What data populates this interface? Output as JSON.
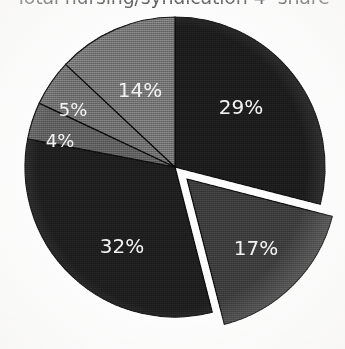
{
  "title": {
    "text": "Total nursing/syndication 4- share",
    "clipped": true
  },
  "chart_data": {
    "type": "pie",
    "title": "Total nursing/syndication 4- share",
    "xlabel": "",
    "ylabel": "",
    "grid": false,
    "legend": "none",
    "start_angle_deg": 0,
    "direction": "clockwise",
    "center": {
      "x": 175,
      "y": 158
    },
    "radius": 150,
    "total_pct": 101,
    "labels_inside": true,
    "label_color": "#f2f2f2",
    "categories": [
      "29%",
      "17%",
      "32%",
      "4%",
      "5%",
      "14%"
    ],
    "values": [
      29,
      17,
      32,
      4,
      5,
      14
    ],
    "slices": [
      {
        "label": "29%",
        "value": 29,
        "color": "#1c1c1c",
        "exploded": false,
        "start_deg": 0,
        "end_deg": 104.4,
        "label_x": 241,
        "label_y": 98
      },
      {
        "label": "17%",
        "value": 17,
        "color": "#3c3c3c",
        "exploded": true,
        "explode_offset": 17,
        "start_deg": 104.4,
        "end_deg": 165.6,
        "label_x": 256,
        "label_y": 239
      },
      {
        "label": "32%",
        "value": 32,
        "color": "#1e1e1e",
        "exploded": false,
        "start_deg": 165.6,
        "end_deg": 280.8,
        "label_x": 122,
        "label_y": 237
      },
      {
        "label": "4%",
        "value": 4,
        "color": "#5e5e5e",
        "exploded": false,
        "start_deg": 280.8,
        "end_deg": 295.2,
        "label_x": 60,
        "label_y": 131
      },
      {
        "label": "5%",
        "value": 5,
        "color": "#6e6e6e",
        "exploded": false,
        "start_deg": 295.2,
        "end_deg": 313.2,
        "label_x": 73,
        "label_y": 100
      },
      {
        "label": "14%",
        "value": 14,
        "color": "#737373",
        "exploded": false,
        "start_deg": 313.2,
        "end_deg": 360,
        "label_x": 140,
        "label_y": 81
      }
    ],
    "outline_color": "#0a0a0a",
    "gap_color": "#ffffff",
    "background": "#fdfdfd"
  }
}
